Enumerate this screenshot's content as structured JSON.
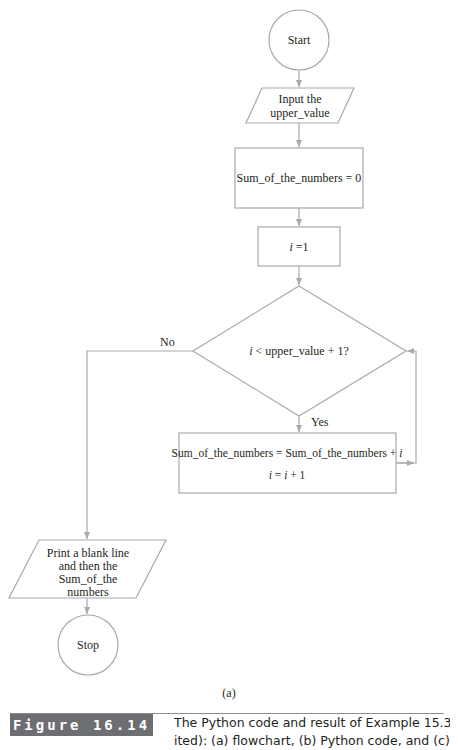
{
  "flowchart": {
    "start": {
      "label": "Start"
    },
    "input": {
      "line1": "Input the",
      "line2": "upper_value"
    },
    "init_sum": {
      "label": "Sum_of_the_numbers = 0"
    },
    "init_i": {
      "var": "i",
      "rest": " =1"
    },
    "decision": {
      "var": "i",
      "rest": " < upper_value + 1?"
    },
    "yes_label": "Yes",
    "no_label": "No",
    "body": {
      "line1_text": "Sum_of_the_numbers = Sum_of_the_numbers + ",
      "line1_var": "i",
      "line2_var1": "i",
      "line2_mid": " = ",
      "line2_var2": "i",
      "line2_rest": " + 1"
    },
    "output": {
      "line1": "Print a blank line",
      "line2": "and then the",
      "line3": "Sum_of_the",
      "line4": "numbers"
    },
    "stop": {
      "label": "Stop"
    }
  },
  "figure": {
    "sub_label": "(a)",
    "number_label": "Figure 16.14",
    "caption": "The Python code and result of Example 15.3 (revis-",
    "caption_line2": "ited): (a) flowchart, (b) Python code, and (c) result"
  },
  "colors": {
    "stroke": "#a7a9ac",
    "text": "#231f20",
    "label_bg": "#6d6e71"
  }
}
